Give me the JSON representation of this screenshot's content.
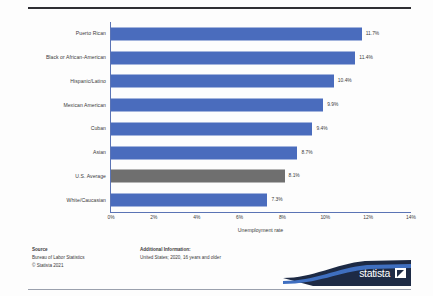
{
  "chart_data": {
    "type": "bar",
    "orientation": "horizontal",
    "title": "",
    "xlabel": "Unemployment rate",
    "ylabel": "",
    "xlim": [
      0,
      14
    ],
    "xticks": [
      "0%",
      "2%",
      "4%",
      "6%",
      "8%",
      "10%",
      "12%",
      "14%"
    ],
    "xtick_values": [
      0,
      2,
      4,
      6,
      8,
      10,
      12,
      14
    ],
    "grid": false,
    "legend": "none",
    "categories": [
      "Puerto Rican",
      "Black or African-American",
      "Hispanic/Latino",
      "Mexican American",
      "Cuban",
      "Asian",
      "U.S. Average",
      "White/Caucasian"
    ],
    "values": [
      11.7,
      11.4,
      10.4,
      9.9,
      9.4,
      8.7,
      8.1,
      7.3
    ],
    "value_labels": [
      "11.7%",
      "11.4%",
      "10.4%",
      "9.9%",
      "9.4%",
      "8.7%",
      "8.1%",
      "7.3%"
    ],
    "bar_colors": [
      "blue",
      "blue",
      "blue",
      "blue",
      "blue",
      "blue",
      "gray",
      "blue"
    ],
    "colors": {
      "blue": "#4a6cbd",
      "gray": "#6f6f6f",
      "axis": "#5b74b5",
      "rule": "#2e2e33",
      "banner_dark": "#1d2a45",
      "banner_blue": "#3f6fc0"
    }
  },
  "footer": {
    "source_heading": "Source",
    "source_line1": "Bureau of Labor Statistics",
    "source_line2": "© Statista 2021",
    "additional_heading": "Additional Information:",
    "additional_line1": "United States; 2020, 16 years and older"
  },
  "branding": {
    "logo_text": "statista"
  }
}
